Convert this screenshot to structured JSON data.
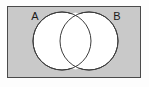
{
  "figure": {
    "kind": "venn-diagram",
    "set_count": 2,
    "shading_description": "universal set rectangle shaded gray; both circles unshaded white including their intersection"
  },
  "universal_set": {
    "name": "universal-set-rectangle",
    "label": "",
    "fill_color": "#c9c9c9",
    "stroke_color": "#4a4a4a",
    "x": 7,
    "y": 6,
    "width": 134,
    "height": 72
  },
  "circles": [
    {
      "label": "A",
      "name": "circle-a",
      "cx": 62,
      "cy": 41,
      "r": 29,
      "fill_color": "#ffffff",
      "stroke_color": "#3c3c3c",
      "label_x": 35,
      "label_y": 20
    },
    {
      "label": "B",
      "name": "circle-b",
      "cx": 89,
      "cy": 41,
      "r": 29,
      "fill_color": "#ffffff",
      "stroke_color": "#3c3c3c",
      "label_x": 117,
      "label_y": 20
    }
  ],
  "intersection": {
    "name": "intersection-region",
    "fill_color": "#ffffff",
    "shaded": false
  },
  "palette": {
    "page_background": "#fdfdfd",
    "rectangle_fill": "#c9c9c9",
    "circle_fill": "#ffffff",
    "outline": "#3c3c3c",
    "label_text": "#1a1a1a"
  }
}
